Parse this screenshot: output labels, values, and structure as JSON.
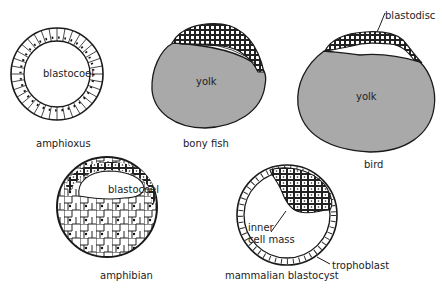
{
  "figure": {
    "panels": [
      {
        "id": "amphioxus",
        "caption": "amphioxus",
        "inner_label": "blastocoel"
      },
      {
        "id": "bony-fish",
        "caption": "bony fish",
        "inner_label": "yolk"
      },
      {
        "id": "bird",
        "caption": "bird",
        "inner_label": "yolk",
        "callout": "blastodisc"
      },
      {
        "id": "amphibian",
        "caption": "amphibian",
        "inner_label": "blastocoel"
      },
      {
        "id": "mammalian-blastocyst",
        "caption": "mammalian blastocyst",
        "callout_1": "inner cell mass",
        "callout_1a": "inner",
        "callout_1b": "cell mass",
        "callout_2": "trophoblast"
      }
    ],
    "colors": {
      "yolk": "#a9a9a9",
      "line": "#1a1a1a",
      "background": "#ffffff"
    }
  }
}
